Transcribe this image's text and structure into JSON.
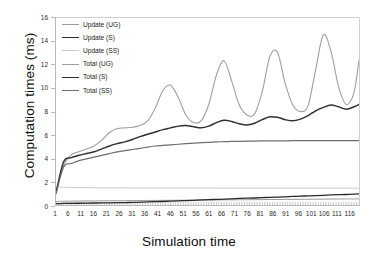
{
  "chart_data": {
    "type": "line",
    "title": "",
    "xlabel": "Simulation time",
    "ylabel": "Computation times (ms)",
    "xlim": [
      1,
      120
    ],
    "ylim": [
      0,
      16
    ],
    "grid": false,
    "legend_position": "upper-left-inside",
    "ytick_labels": [
      "0",
      "2",
      "4",
      "6",
      "8",
      "10",
      "12",
      "14",
      "16"
    ],
    "ytick_values": [
      0,
      2,
      4,
      6,
      8,
      10,
      12,
      14,
      16
    ],
    "xtick_labels": [
      "1",
      "6",
      "11",
      "16",
      "21",
      "26",
      "31",
      "36",
      "41",
      "46",
      "51",
      "56",
      "61",
      "66",
      "71",
      "76",
      "81",
      "86",
      "91",
      "96",
      "101",
      "106",
      "111",
      "116"
    ],
    "xtick_values": [
      1,
      6,
      11,
      16,
      21,
      26,
      31,
      36,
      41,
      46,
      51,
      56,
      61,
      66,
      71,
      76,
      81,
      86,
      91,
      96,
      101,
      106,
      111,
      116
    ],
    "x": [
      1,
      4,
      7,
      10,
      13,
      16,
      19,
      22,
      25,
      28,
      31,
      34,
      37,
      40,
      43,
      46,
      49,
      52,
      55,
      58,
      61,
      64,
      67,
      70,
      73,
      76,
      79,
      82,
      85,
      88,
      91,
      94,
      97,
      100,
      103,
      106,
      109,
      112,
      115,
      118,
      120
    ],
    "series": [
      {
        "name": "Update (UG)",
        "color": "#9a9a9a",
        "width": 1.0,
        "values": [
          0.3,
          0.32,
          0.33,
          0.34,
          0.35,
          0.35,
          0.36,
          0.36,
          0.37,
          0.37,
          0.38,
          0.38,
          0.39,
          0.39,
          0.4,
          0.4,
          0.41,
          0.41,
          0.42,
          0.42,
          0.43,
          0.43,
          0.44,
          0.44,
          0.45,
          0.45,
          0.46,
          0.46,
          0.47,
          0.47,
          0.48,
          0.48,
          0.49,
          0.49,
          0.5,
          0.5,
          0.51,
          0.51,
          0.52,
          0.52,
          0.52
        ]
      },
      {
        "name": "Update (S)",
        "color": "#2a2a2a",
        "width": 1.3,
        "values": [
          0.12,
          0.13,
          0.14,
          0.15,
          0.16,
          0.17,
          0.18,
          0.19,
          0.2,
          0.21,
          0.22,
          0.24,
          0.26,
          0.28,
          0.3,
          0.33,
          0.36,
          0.38,
          0.4,
          0.43,
          0.46,
          0.48,
          0.5,
          0.53,
          0.56,
          0.58,
          0.6,
          0.63,
          0.66,
          0.68,
          0.7,
          0.73,
          0.76,
          0.78,
          0.8,
          0.83,
          0.86,
          0.88,
          0.9,
          0.93,
          0.95
        ]
      },
      {
        "name": "Update (SS)",
        "color": "#c9c9c9",
        "width": 1.0,
        "values": [
          1.55,
          1.52,
          1.5,
          1.49,
          1.48,
          1.48,
          1.47,
          1.47,
          1.47,
          1.46,
          1.46,
          1.46,
          1.46,
          1.45,
          1.45,
          1.45,
          1.45,
          1.45,
          1.45,
          1.45,
          1.45,
          1.45,
          1.44,
          1.44,
          1.44,
          1.44,
          1.44,
          1.44,
          1.44,
          1.44,
          1.44,
          1.44,
          1.44,
          1.44,
          1.44,
          1.44,
          1.44,
          1.44,
          1.44,
          1.44,
          1.44
        ]
      },
      {
        "name": "Total (UG)",
        "color": "#9e9e9e",
        "width": 1.1,
        "values": [
          1.1,
          3.4,
          4.3,
          4.55,
          4.8,
          5.05,
          5.55,
          6.2,
          6.55,
          6.6,
          6.65,
          6.8,
          7.2,
          8.3,
          9.8,
          10.25,
          9.2,
          7.7,
          7.05,
          7.2,
          8.6,
          11.1,
          12.35,
          10.6,
          8.55,
          7.7,
          7.8,
          9.7,
          12.7,
          13.05,
          10.4,
          8.55,
          8.0,
          8.5,
          11.6,
          14.55,
          13.15,
          10.1,
          8.6,
          9.6,
          12.4
        ]
      },
      {
        "name": "Total (S)",
        "color": "#303030",
        "width": 1.5,
        "values": [
          1.05,
          3.7,
          4.05,
          4.25,
          4.4,
          4.55,
          4.8,
          5.05,
          5.25,
          5.4,
          5.6,
          5.85,
          6.05,
          6.25,
          6.45,
          6.6,
          6.75,
          6.8,
          6.7,
          6.6,
          6.75,
          7.05,
          7.25,
          7.15,
          6.95,
          6.85,
          7.0,
          7.3,
          7.55,
          7.5,
          7.3,
          7.2,
          7.35,
          7.65,
          8.05,
          8.35,
          8.55,
          8.4,
          8.2,
          8.4,
          8.6
        ]
      },
      {
        "name": "Total (SS)",
        "color": "#6e6e6e",
        "width": 1.2,
        "values": [
          0.95,
          3.25,
          3.55,
          3.8,
          3.95,
          4.1,
          4.25,
          4.4,
          4.55,
          4.65,
          4.75,
          4.85,
          4.95,
          5.05,
          5.1,
          5.15,
          5.2,
          5.25,
          5.3,
          5.33,
          5.36,
          5.4,
          5.42,
          5.44,
          5.45,
          5.46,
          5.47,
          5.48,
          5.48,
          5.49,
          5.49,
          5.5,
          5.5,
          5.5,
          5.5,
          5.5,
          5.5,
          5.5,
          5.5,
          5.5,
          5.5
        ]
      }
    ]
  },
  "legend": {
    "items": [
      {
        "label": "Update (UG)"
      },
      {
        "label": "Update (S)"
      },
      {
        "label": "Update (SS)"
      },
      {
        "label": "Total (UG)"
      },
      {
        "label": "Total (S)"
      },
      {
        "label": "Total (SS)"
      }
    ]
  }
}
